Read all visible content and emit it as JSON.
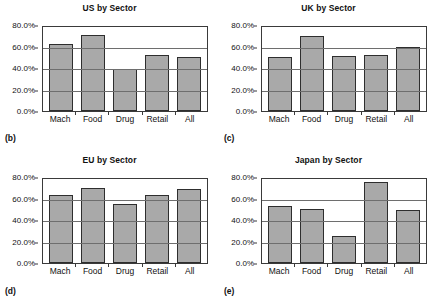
{
  "figure": {
    "panel_labels": [
      "(b)",
      "(c)",
      "(d)",
      "(e)"
    ]
  },
  "chart_data": [
    {
      "type": "bar",
      "title": "US by Sector",
      "panel_label": "(b)",
      "categories": [
        "Mach",
        "Food",
        "Drug",
        "Retail",
        "All"
      ],
      "values": [
        62.0,
        71.0,
        39.5,
        52.5,
        50.0
      ],
      "xlabel": "",
      "ylabel": "",
      "ylim": [
        0,
        80
      ],
      "yticks": [
        0,
        20,
        40,
        60,
        80
      ],
      "ytick_labels": [
        "0.0%",
        "20.0%",
        "40.0%",
        "60.0%",
        "80.0%"
      ],
      "grid": true,
      "legend": "none",
      "bar_color": "#a9a9a9",
      "bar_border_color": "#2e2e2e"
    },
    {
      "type": "bar",
      "title": "UK by Sector",
      "panel_label": "(c)",
      "categories": [
        "Mach",
        "Food",
        "Drug",
        "Retail",
        "All"
      ],
      "values": [
        50.5,
        70.0,
        51.5,
        52.5,
        60.0
      ],
      "xlabel": "",
      "ylabel": "",
      "ylim": [
        0,
        80
      ],
      "yticks": [
        0,
        20,
        40,
        60,
        80
      ],
      "ytick_labels": [
        "0.0%",
        "20.0%",
        "40.0%",
        "60.0%",
        "80.0%"
      ],
      "grid": true,
      "legend": "none",
      "bar_color": "#a9a9a9",
      "bar_border_color": "#2e2e2e"
    },
    {
      "type": "bar",
      "title": "EU by Sector",
      "panel_label": "(d)",
      "categories": [
        "Mach",
        "Food",
        "Drug",
        "Retail",
        "All"
      ],
      "values": [
        63.0,
        70.0,
        54.5,
        63.5,
        68.5
      ],
      "xlabel": "",
      "ylabel": "",
      "ylim": [
        0,
        80
      ],
      "yticks": [
        0,
        20,
        40,
        60,
        80
      ],
      "ytick_labels": [
        "0.0%",
        "20.0%",
        "40.0%",
        "60.0%",
        "80.0%"
      ],
      "grid": true,
      "legend": "none",
      "bar_color": "#a9a9a9",
      "bar_border_color": "#2e2e2e"
    },
    {
      "type": "bar",
      "title": "Japan by Sector",
      "panel_label": "(e)",
      "categories": [
        "Mach",
        "Food",
        "Drug",
        "Retail",
        "All"
      ],
      "values": [
        53.0,
        50.0,
        25.5,
        75.5,
        49.0
      ],
      "xlabel": "",
      "ylabel": "",
      "ylim": [
        0,
        80
      ],
      "yticks": [
        0,
        20,
        40,
        60,
        80
      ],
      "ytick_labels": [
        "0.0%",
        "20.0%",
        "40.0%",
        "60.0%",
        "80.0%"
      ],
      "grid": true,
      "legend": "none",
      "bar_color": "#a9a9a9",
      "bar_border_color": "#2e2e2e"
    }
  ]
}
